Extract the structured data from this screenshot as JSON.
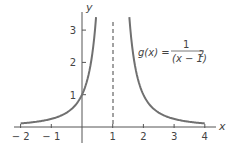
{
  "chart_data": {
    "type": "line",
    "title": "",
    "xlabel": "x",
    "ylabel": "y",
    "xlim": [
      -2,
      4
    ],
    "ylim": [
      0,
      3.4
    ],
    "x_ticks": [
      -2,
      -1,
      1,
      2,
      3,
      4
    ],
    "x_tick_labels": [
      "− 2",
      "− 1",
      "1",
      "2",
      "3",
      "4"
    ],
    "y_ticks": [
      1,
      2,
      3
    ],
    "y_tick_labels": [
      "1",
      "2",
      "3"
    ],
    "grid": false,
    "legend": null,
    "series": [
      {
        "name": "g(x) = 1/(x-1)^2",
        "function": "1/(x-1)^2",
        "branches": [
          {
            "x": [
              -2,
              -1.5,
              -1,
              -0.5,
              0,
              0.25,
              0.4,
              0.458
            ],
            "y": [
              0.111,
              0.16,
              0.25,
              0.444,
              1,
              1.778,
              2.778,
              3.4
            ]
          },
          {
            "x": [
              1.542,
              1.6,
              1.75,
              2,
              2.5,
              3,
              3.5,
              4
            ],
            "y": [
              3.4,
              2.778,
              1.778,
              1,
              0.444,
              0.25,
              0.16,
              0.111
            ]
          }
        ],
        "color": "#707070"
      }
    ],
    "annotations": [
      {
        "type": "vertical-asymptote",
        "x": 1,
        "style": "dashed"
      },
      {
        "type": "label",
        "text_lhs": "g(x) =",
        "numerator": "1",
        "denominator": "(x − 1)",
        "exponent": "2"
      }
    ]
  },
  "labels": {
    "x_axis": "x",
    "y_axis": "y",
    "formula_lhs": "g(x) =",
    "formula_num": "1",
    "formula_den": "(x − 1)",
    "formula_exp": "2"
  },
  "colors": {
    "curve": "#707070",
    "axis": "#555555",
    "text": "#444444"
  }
}
